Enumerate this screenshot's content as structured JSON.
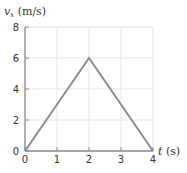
{
  "chart_data": {
    "type": "line",
    "title": "",
    "xlabel": "t (s)",
    "ylabel": "v_x (m/s)",
    "ylabel_main": "v",
    "ylabel_sub": "x",
    "ylabel_unit": " (m/s)",
    "xlabel_var": "t",
    "xlabel_unit": " (s)",
    "xlim": [
      0,
      4
    ],
    "ylim": [
      0,
      8
    ],
    "xticks": [
      "0",
      "1",
      "2",
      "3",
      "4"
    ],
    "yticks": [
      "0",
      "2",
      "4",
      "6",
      "8"
    ],
    "grid": true,
    "legend": null,
    "series": [
      {
        "name": "v_x",
        "x": [
          0,
          2,
          4
        ],
        "y": [
          0,
          6,
          0
        ],
        "color": "#8c8c8c"
      }
    ]
  },
  "style": {
    "line_color": "#8c8c8c",
    "axis_color": "#8c8c8c",
    "grid_color": "#e6e6e6"
  }
}
